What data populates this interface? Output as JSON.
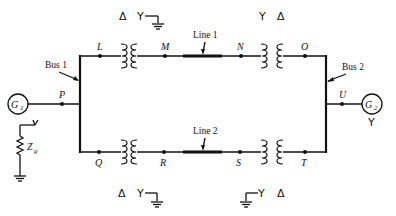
{
  "diagram": {
    "type": "power-system one-line diagram",
    "buses": [
      {
        "id": "bus1",
        "label": "Bus 1"
      },
      {
        "id": "bus2",
        "label": "Bus 2"
      }
    ],
    "generators": [
      {
        "id": "g1",
        "label": "G",
        "subscript": "1",
        "bus": "Bus 1",
        "node": "P",
        "grounding": "Z_g"
      },
      {
        "id": "g2",
        "label": "G",
        "subscript": "2",
        "bus": "Bus 2",
        "node": "U",
        "connection": "Y"
      }
    ],
    "nodes": {
      "L": "L",
      "M": "M",
      "N": "N",
      "O": "O",
      "P": "P",
      "Q": "Q",
      "R": "R",
      "S": "S",
      "T": "T",
      "U": "U"
    },
    "lines": [
      {
        "id": "line1",
        "label": "Line 1",
        "from": "M",
        "to": "N"
      },
      {
        "id": "line2",
        "label": "Line 2",
        "from": "R",
        "to": "S"
      }
    ],
    "transformers": [
      {
        "id": "t1",
        "between": [
          "L",
          "M"
        ],
        "primary": "Δ",
        "secondary": "Y",
        "secondary_grounded": true
      },
      {
        "id": "t2",
        "between": [
          "N",
          "O"
        ],
        "primary": "Y",
        "secondary": "Δ",
        "primary_grounded": false
      },
      {
        "id": "t3",
        "between": [
          "Q",
          "R"
        ],
        "primary": "Δ",
        "secondary": "Y",
        "secondary_grounded": true
      },
      {
        "id": "t4",
        "between": [
          "S",
          "T"
        ],
        "primary": "Y",
        "secondary": "Δ",
        "primary_grounded": true
      }
    ],
    "impedance": {
      "label": "Z",
      "subscript": "g"
    },
    "symbols": {
      "delta": "Δ",
      "wye": "Y"
    }
  }
}
